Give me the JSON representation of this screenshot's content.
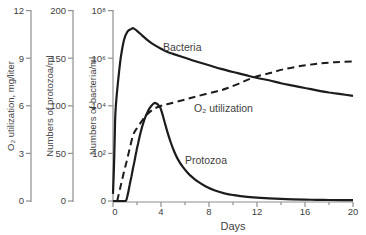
{
  "chart_data": {
    "type": "line",
    "title": "",
    "grid": false,
    "legend": "none",
    "colors": {
      "curve": "#1c1c1c",
      "axis": "#8f8f8f",
      "text": "#3f3f3f",
      "background": "#ffffff"
    },
    "x_axis": {
      "label": "Days",
      "range": [
        0,
        20
      ],
      "ticks": [
        "0",
        "4",
        "8",
        "12",
        "16",
        "20"
      ],
      "tick_values": [
        0,
        4,
        8,
        12,
        16,
        20
      ],
      "minor_tick_values": [
        2,
        6,
        10,
        14,
        18
      ]
    },
    "y_axes": [
      {
        "id": "o2",
        "title": "O₂ utilization, mg/liter",
        "range": [
          0,
          12
        ],
        "ticks": [
          "0",
          "3",
          "6",
          "9",
          "12"
        ],
        "scale": "linear"
      },
      {
        "id": "protozoa",
        "title": "Numbers of protozoa/ml",
        "range": [
          0,
          200
        ],
        "ticks": [
          "0",
          "50",
          "100",
          "150",
          "200"
        ],
        "scale": "linear"
      },
      {
        "id": "bacteria",
        "title": "Numbers of bacteria/ml",
        "range": [
          0,
          8
        ],
        "ticks": [
          "0",
          "10²",
          "10⁴",
          "10⁶",
          "10⁸"
        ],
        "scale": "log10-exponent"
      }
    ],
    "series": [
      {
        "name": "Bacteria",
        "axis": "bacteria",
        "style": "solid",
        "units": "log10(cells/ml)",
        "points": [
          [
            0,
            0.3
          ],
          [
            0.08,
            1.5
          ],
          [
            0.15,
            2.8
          ],
          [
            0.19,
            3.6
          ],
          [
            0.3,
            4.4
          ],
          [
            0.42,
            5.0
          ],
          [
            0.64,
            6.0
          ],
          [
            0.92,
            6.77
          ],
          [
            1.19,
            7.11
          ],
          [
            1.53,
            7.23
          ],
          [
            1.7,
            7.26
          ],
          [
            2.0,
            7.15
          ],
          [
            2.4,
            6.97
          ],
          [
            2.9,
            6.75
          ],
          [
            3.3,
            6.6
          ],
          [
            4.0,
            6.4
          ],
          [
            4.6,
            6.25
          ],
          [
            5.0,
            6.18
          ],
          [
            5.8,
            6.05
          ],
          [
            7,
            5.85
          ],
          [
            8,
            5.7
          ],
          [
            9,
            5.55
          ],
          [
            10,
            5.42
          ],
          [
            11,
            5.3
          ],
          [
            11.75,
            5.2
          ],
          [
            13,
            5.07
          ],
          [
            14,
            4.95
          ],
          [
            15,
            4.85
          ],
          [
            16,
            4.75
          ],
          [
            17,
            4.65
          ],
          [
            18,
            4.56
          ],
          [
            19,
            4.49
          ],
          [
            20,
            4.42
          ]
        ]
      },
      {
        "name": "Protozoa",
        "axis": "protozoa",
        "style": "solid",
        "units": "protozoa/ml",
        "points": [
          [
            0,
            0
          ],
          [
            0.6,
            0
          ],
          [
            1.06,
            0
          ],
          [
            1.25,
            8
          ],
          [
            1.39,
            17
          ],
          [
            1.53,
            25.5
          ],
          [
            1.67,
            34.3
          ],
          [
            1.81,
            43
          ],
          [
            1.94,
            51.8
          ],
          [
            2.08,
            60
          ],
          [
            2.3,
            72
          ],
          [
            2.6,
            85
          ],
          [
            2.9,
            94
          ],
          [
            3.2,
            100
          ],
          [
            3.5,
            103
          ],
          [
            3.9,
            99
          ],
          [
            4.1,
            92
          ],
          [
            4.3,
            83
          ],
          [
            4.5,
            74
          ],
          [
            4.8,
            62
          ],
          [
            5.1,
            52
          ],
          [
            5.4,
            44
          ],
          [
            5.8,
            36
          ],
          [
            6.2,
            30
          ],
          [
            6.6,
            25
          ],
          [
            7,
            21
          ],
          [
            7.7,
            15.5
          ],
          [
            8.5,
            11
          ],
          [
            9.3,
            8
          ],
          [
            10,
            6.3
          ],
          [
            11,
            4.6
          ],
          [
            12,
            3.5
          ],
          [
            13,
            2.8
          ],
          [
            14,
            2.2
          ],
          [
            15,
            1.8
          ],
          [
            16,
            1.5
          ],
          [
            17,
            1.2
          ],
          [
            18,
            1.0
          ],
          [
            19,
            0.9
          ],
          [
            20,
            0.8
          ]
        ]
      },
      {
        "name": "O₂ utilization",
        "axis": "o2",
        "style": "dashed",
        "units": "mg/liter",
        "points": [
          [
            0.35,
            0
          ],
          [
            0.53,
            0.6
          ],
          [
            0.72,
            1.2
          ],
          [
            0.92,
            1.85
          ],
          [
            1.14,
            2.5
          ],
          [
            1.39,
            3.3
          ],
          [
            1.7,
            4.2
          ],
          [
            2.1,
            4.7
          ],
          [
            2.5,
            5.15
          ],
          [
            2.9,
            5.5
          ],
          [
            3.2,
            5.7
          ],
          [
            3.5,
            5.85
          ],
          [
            4,
            6.0
          ],
          [
            4.5,
            6.1
          ],
          [
            5.8,
            6.35
          ],
          [
            7,
            6.6
          ],
          [
            8.6,
            6.9
          ],
          [
            9.5,
            7.1
          ],
          [
            10.5,
            7.4
          ],
          [
            11.75,
            7.8
          ],
          [
            13,
            8.05
          ],
          [
            14.2,
            8.3
          ],
          [
            15.6,
            8.5
          ],
          [
            17,
            8.65
          ],
          [
            18.5,
            8.75
          ],
          [
            20,
            8.8
          ]
        ]
      }
    ],
    "annotations": [
      {
        "text": "Bacteria",
        "x": 163,
        "y": 51
      },
      {
        "text": "O₂ utilization",
        "x": 194,
        "y": 112
      },
      {
        "text": "Protozoa",
        "x": 185,
        "y": 164
      }
    ]
  }
}
